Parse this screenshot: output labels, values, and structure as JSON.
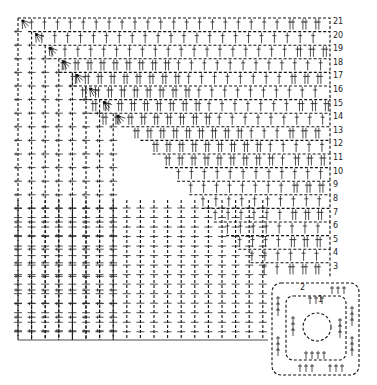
{
  "diagram": {
    "type": "crochet-chart",
    "ink_color": "#111111",
    "background": "#ffffff",
    "row_labels": [
      "21",
      "20",
      "19",
      "18",
      "17",
      "16",
      "15",
      "14",
      "13",
      "12",
      "11",
      "10",
      "9",
      "8",
      "7",
      "6",
      "5",
      "4",
      "3",
      "2",
      "1"
    ],
    "grid": {
      "left": 18,
      "top": 18,
      "cell": 13.6,
      "rows": 19,
      "cols": 23
    },
    "motif": {
      "rounds": [
        "1",
        "2"
      ],
      "center": "magic-ring"
    }
  }
}
